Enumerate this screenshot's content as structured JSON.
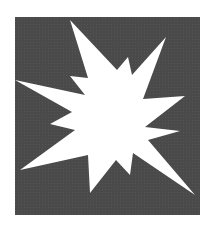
{
  "image": {
    "alt": "White starburst explosion icon on a dark grey square",
    "icon": "starburst-explosion-icon",
    "colors": {
      "background": "#ffffff",
      "square_fill": "#4a4a4a",
      "burst_fill": "#ffffff"
    },
    "square": {
      "x": 15,
      "y": 17,
      "width": 185,
      "height": 198
    },
    "burst_points": "70,20 117,70 128,57 132,75 166,37 143,99 185,96 145,127 180,131 148,140 195,195 133,153 130,175 116,160 90,193 88,155 20,170 75,130 50,124 72,112 15,80 85,95 70,76 88,78"
  }
}
